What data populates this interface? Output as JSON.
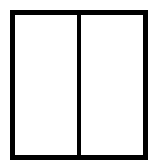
{
  "diagram": {
    "type": "two-panel-frame",
    "panes": [
      {
        "id": "left",
        "label": ""
      },
      {
        "id": "right",
        "label": ""
      }
    ],
    "colors": {
      "stroke": "#000000",
      "fill": "#ffffff"
    }
  }
}
